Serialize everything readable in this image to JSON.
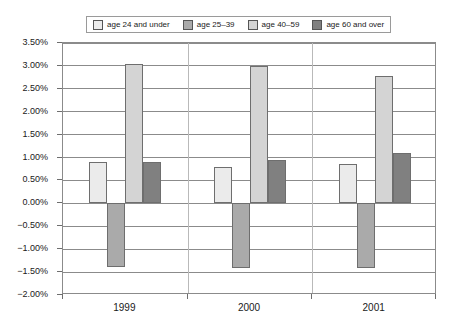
{
  "chart_data": {
    "type": "bar",
    "title": "",
    "subtitle": "",
    "xlabel": "",
    "ylabel": "",
    "categories": [
      "1999",
      "2000",
      "2001"
    ],
    "series": [
      {
        "name": "age 24 and under",
        "color": "#ebebeb",
        "values": [
          0.9,
          0.8,
          0.85
        ]
      },
      {
        "name": "age 25–39",
        "color": "#aaaaaa",
        "values": [
          -1.38,
          -1.4,
          -1.4
        ]
      },
      {
        "name": "age 40–59",
        "color": "#d4d4d4",
        "values": [
          3.05,
          3.0,
          2.78
        ]
      },
      {
        "name": "age 60 and over",
        "color": "#808080",
        "values": [
          0.9,
          0.95,
          1.1
        ]
      }
    ],
    "ylim": [
      -2.0,
      3.5
    ],
    "ytick_step": 0.5,
    "ytick_labels": [
      "3.50%",
      "3.00%",
      "2.50%",
      "2.00%",
      "1.50%",
      "1.00%",
      "0.50%",
      "0.00%",
      "−0.50%",
      "−1.00%",
      "−1.50%",
      "−2.00%"
    ],
    "ytick_values": [
      3.5,
      3.0,
      2.5,
      2.0,
      1.5,
      1.0,
      0.5,
      0.0,
      -0.5,
      -1.0,
      -1.5,
      -2.0
    ],
    "grid": true,
    "legend_position": "top"
  },
  "legend": {
    "items": [
      {
        "label": "age 24 and under"
      },
      {
        "label": "age 25–39"
      },
      {
        "label": "age 40–59"
      },
      {
        "label": "age 60 and over"
      }
    ]
  },
  "colors": {
    "series_1": "#ebebeb",
    "series_2": "#aaaaaa",
    "series_3": "#d4d4d4",
    "series_4": "#808080",
    "axis": "#8b8b8b",
    "text": "#1a1a1a",
    "background": "#ffffff"
  }
}
